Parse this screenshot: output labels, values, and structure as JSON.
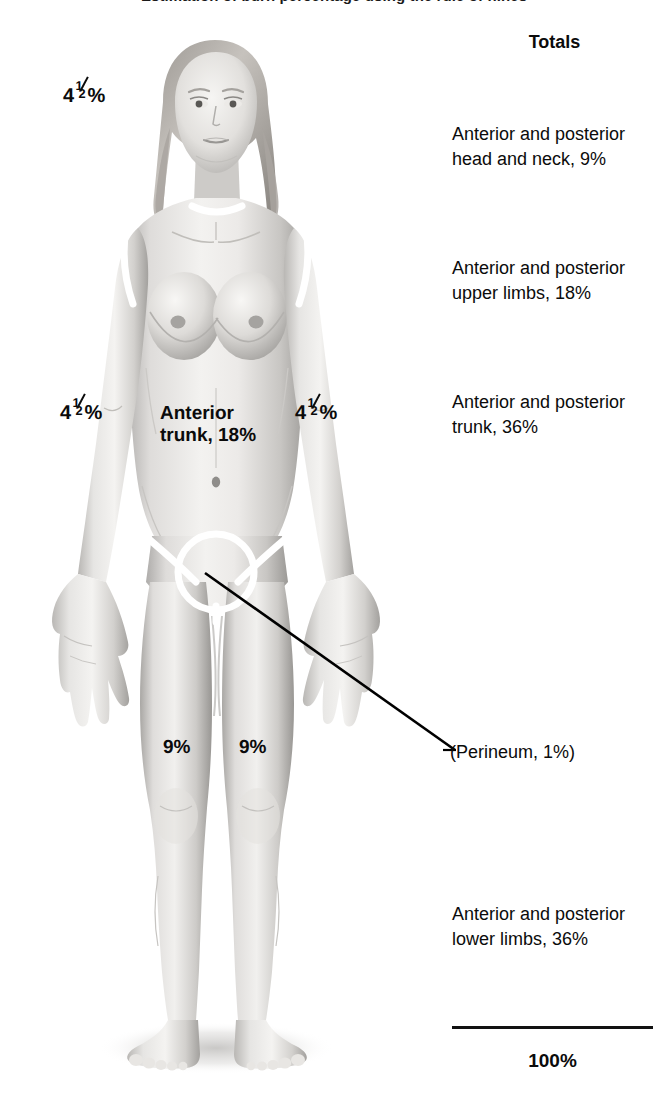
{
  "caption": {
    "cut_off_line": "Estimation of burn percentage using the rule of nines"
  },
  "figure": {
    "alt_name": "anterior-female-body-diagram",
    "view": "Anterior",
    "demarcations": [
      "neck",
      "left-shoulder",
      "right-shoulder",
      "left-groin",
      "right-groin",
      "perineum-circle"
    ]
  },
  "body_labels": {
    "head": {
      "whole": "4",
      "numerator": "1",
      "denominator": "2",
      "suffix": "%"
    },
    "arm_left": {
      "whole": "4",
      "numerator": "1",
      "denominator": "2",
      "suffix": "%"
    },
    "arm_right": {
      "whole": "4",
      "numerator": "1",
      "denominator": "2",
      "suffix": "%"
    },
    "trunk_line1": "Anterior",
    "trunk_line2": "trunk, 18%",
    "leg_left": "9%",
    "leg_right": "9%",
    "perineum": "(Perineum, 1%)"
  },
  "totals": {
    "title": "Totals",
    "items": [
      {
        "line1": "Anterior and posterior",
        "line2": "head and neck, 9%"
      },
      {
        "line1": "Anterior and posterior",
        "line2": "upper limbs, 18%"
      },
      {
        "line1": "Anterior and posterior",
        "line2": "trunk, 36%"
      },
      {
        "line1": "Anterior and posterior",
        "line2": "lower limbs, 36%"
      }
    ],
    "sum": "100%"
  },
  "colors": {
    "text": "#0b0b0b",
    "rule": "#111111",
    "demarcation": "#ffffff",
    "leader": "#000000",
    "skin_light": "#f2f1ef",
    "skin_mid": "#c9c7c4",
    "skin_dark": "#8e8c8a",
    "background": "#ffffff"
  }
}
